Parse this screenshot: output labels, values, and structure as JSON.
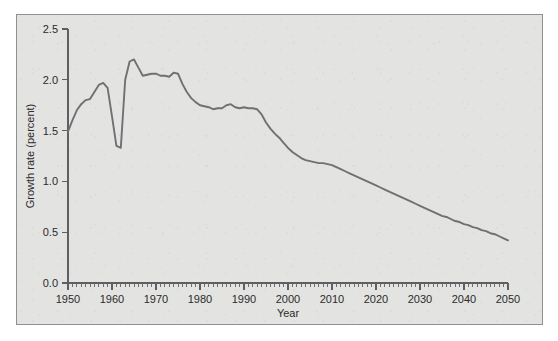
{
  "figure": {
    "background_color": "#e3e3e1",
    "frame_color": "#8e9093",
    "line_color": "#6e7073",
    "text_color": "#2b2b2b"
  },
  "chart_data": {
    "type": "line",
    "title": "",
    "xlabel": "Year",
    "ylabel": "Growth rate (percent)",
    "xlim": [
      1950,
      2050
    ],
    "ylim": [
      0.0,
      2.5
    ],
    "grid": false,
    "legend": null,
    "x_major_ticks": [
      1950,
      1960,
      1970,
      1980,
      1990,
      2000,
      2010,
      2020,
      2030,
      2040,
      2050
    ],
    "x_tick_labels": [
      "1950",
      "1960",
      "1970",
      "1980",
      "1990",
      "2000",
      "2010",
      "2020",
      "2030",
      "2040",
      "2050"
    ],
    "x_minor_tick_step": 1,
    "y_major_ticks": [
      0.0,
      0.5,
      1.0,
      1.5,
      2.0,
      2.5
    ],
    "y_tick_labels": [
      "0.0",
      "0.5",
      "1.0",
      "1.5",
      "2.0",
      "2.5"
    ],
    "series": [
      {
        "name": "World population growth rate",
        "x": [
          1950,
          1951,
          1952,
          1953,
          1954,
          1955,
          1956,
          1957,
          1958,
          1959,
          1960,
          1961,
          1962,
          1963,
          1964,
          1965,
          1966,
          1967,
          1968,
          1969,
          1970,
          1971,
          1972,
          1973,
          1974,
          1975,
          1976,
          1977,
          1978,
          1979,
          1980,
          1981,
          1982,
          1983,
          1984,
          1985,
          1986,
          1987,
          1988,
          1989,
          1990,
          1991,
          1992,
          1993,
          1994,
          1995,
          1996,
          1997,
          1998,
          1999,
          2000,
          2001,
          2002,
          2003,
          2004,
          2005,
          2006,
          2007,
          2008,
          2009,
          2010,
          2011,
          2012,
          2013,
          2014,
          2015,
          2016,
          2017,
          2018,
          2019,
          2020,
          2021,
          2022,
          2023,
          2024,
          2025,
          2026,
          2027,
          2028,
          2029,
          2030,
          2031,
          2032,
          2033,
          2034,
          2035,
          2036,
          2037,
          2038,
          2039,
          2040,
          2041,
          2042,
          2043,
          2044,
          2045,
          2046,
          2047,
          2048,
          2049,
          2050
        ],
        "y": [
          1.49,
          1.6,
          1.7,
          1.76,
          1.8,
          1.81,
          1.88,
          1.95,
          1.97,
          1.92,
          1.64,
          1.35,
          1.33,
          2.0,
          2.18,
          2.2,
          2.12,
          2.04,
          2.05,
          2.06,
          2.06,
          2.04,
          2.04,
          2.03,
          2.07,
          2.06,
          1.96,
          1.88,
          1.82,
          1.78,
          1.75,
          1.74,
          1.73,
          1.71,
          1.72,
          1.72,
          1.75,
          1.76,
          1.73,
          1.72,
          1.73,
          1.72,
          1.72,
          1.71,
          1.66,
          1.58,
          1.52,
          1.47,
          1.43,
          1.38,
          1.33,
          1.29,
          1.26,
          1.23,
          1.21,
          1.2,
          1.19,
          1.18,
          1.18,
          1.17,
          1.16,
          1.14,
          1.12,
          1.1,
          1.08,
          1.06,
          1.04,
          1.02,
          1.0,
          0.98,
          0.96,
          0.94,
          0.92,
          0.9,
          0.88,
          0.86,
          0.84,
          0.82,
          0.8,
          0.78,
          0.76,
          0.74,
          0.72,
          0.7,
          0.68,
          0.66,
          0.65,
          0.63,
          0.61,
          0.6,
          0.58,
          0.57,
          0.55,
          0.54,
          0.52,
          0.51,
          0.49,
          0.48,
          0.46,
          0.44,
          0.42
        ]
      }
    ]
  }
}
